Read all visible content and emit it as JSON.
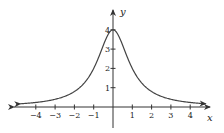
{
  "chart_data": {
    "type": "line",
    "title": "",
    "xlabel": "x",
    "ylabel": "y",
    "function": "y = 4/(1+x^2)",
    "xlim": [
      -4.8,
      4.8
    ],
    "ylim": [
      -1,
      4.5
    ],
    "x_ticks": [
      -4,
      -3,
      -2,
      -1,
      1,
      2,
      3,
      4
    ],
    "x_tick_labels": [
      "−4",
      "−3",
      "−2",
      "−1",
      "1",
      "2",
      "3",
      "4"
    ],
    "y_ticks": [
      1,
      2,
      3,
      4
    ],
    "y_tick_labels": [
      "1",
      "2",
      "3",
      "4"
    ],
    "grid": false,
    "legend": null,
    "series": [
      {
        "name": "y = 4/(1+x^2)",
        "x": [
          -4.8,
          -4,
          -3,
          -2,
          -1.5,
          -1,
          -0.5,
          0,
          0.5,
          1,
          1.5,
          2,
          3,
          4,
          4.8
        ],
        "values": [
          0.17,
          0.24,
          0.4,
          0.8,
          1.23,
          2.0,
          3.2,
          4.0,
          3.2,
          2.0,
          1.23,
          0.8,
          0.4,
          0.24,
          0.17
        ]
      }
    ],
    "arrows": {
      "x_axis": "both ends",
      "y_axis": "top",
      "curve": "both ends"
    },
    "colors": {
      "axis": "#333333",
      "curve": "#444444",
      "text": "#222222"
    }
  }
}
